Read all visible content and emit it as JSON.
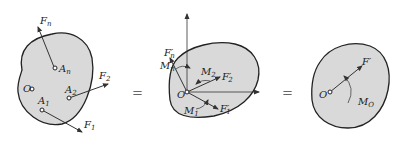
{
  "colors": {
    "body_fill": "#d9d9d9",
    "outline": "#222222",
    "text": "#222222",
    "equals": "#666666"
  },
  "panels": [
    {
      "name": "original-system",
      "origin_label": "O",
      "points": [
        {
          "label": "A",
          "sub": "n"
        },
        {
          "label": "A",
          "sub": "2"
        },
        {
          "label": "A",
          "sub": "1"
        }
      ],
      "forces": [
        {
          "label": "F",
          "sub": "n"
        },
        {
          "label": "F",
          "sub": "2"
        },
        {
          "label": "F",
          "sub": "1"
        }
      ]
    },
    {
      "name": "translated-system",
      "origin_label": "O",
      "forces": [
        {
          "label": "F",
          "sub": "n",
          "prime": "′"
        },
        {
          "label": "F",
          "sub": "2",
          "prime": "′"
        },
        {
          "label": "F",
          "sub": "1",
          "prime": "′"
        }
      ],
      "moments": [
        {
          "label": "M",
          "sub": "n"
        },
        {
          "label": "M",
          "sub": "2"
        },
        {
          "label": "M",
          "sub": "1"
        }
      ]
    },
    {
      "name": "resultant-system",
      "origin_label": "O",
      "force": {
        "label": "F",
        "prime": "′"
      },
      "moment": {
        "label": "M",
        "sub": "O"
      }
    }
  ],
  "equals": [
    "=",
    "="
  ]
}
